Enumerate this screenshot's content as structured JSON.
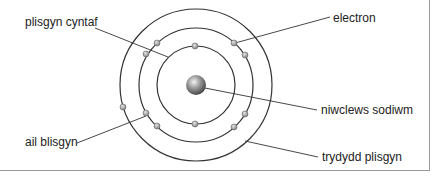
{
  "diagram": {
    "colors": {
      "line": "#333333",
      "electron": "#a8a8a8",
      "nucleus": "#6e6e6e",
      "frame": "#9a9a9a"
    },
    "labels": {
      "first_shell": "plisgyn cyntaf",
      "electron": "electron",
      "nucleus": "niwclews sodiwm",
      "second_shell": "ail blisgyn",
      "third_shell": "trydydd plisgyn"
    },
    "shells": [
      {
        "name": "first",
        "electrons": 2
      },
      {
        "name": "second",
        "electrons": 8
      },
      {
        "name": "third",
        "electrons": 1
      }
    ]
  }
}
